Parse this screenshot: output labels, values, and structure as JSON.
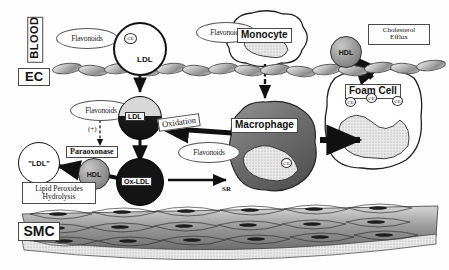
{
  "figure": {
    "type": "biomedical-pathway-diagram"
  },
  "compartments": {
    "blood": "BLOOD",
    "endothelium": "EC",
    "smooth_muscle": "SMC"
  },
  "particles": {
    "ldl_blood": "LDL",
    "ldl_intima": "LDL",
    "ox_ldl": "Ox-LDL",
    "hdl_efflux": "HDL",
    "hdl_paraoxonase": "HDL",
    "ldl_restored": "\"LDL\"",
    "ce_marker": "CE"
  },
  "cells": {
    "monocyte": "Monocyte",
    "macrophage": "Macrophage",
    "foam_cell": "Foam  Cell"
  },
  "flavonoids": {
    "blood": "Flavonoids",
    "monocyte": "Flavonoids",
    "intima": "Flavonoids",
    "macrophage": "Flavonoids"
  },
  "processes": {
    "oxidation": "Oxidation",
    "paraoxonase": "Paraoxonase",
    "lipid_peroxides_line1": "Lipid Peroxides",
    "lipid_peroxides_line2": "Hydrolysis",
    "cholesterol_efflux_line1": "Cholesterol",
    "cholesterol_efflux_line2": "Efflux",
    "activation_sign": "(+)",
    "scavenger_receptor": "SR",
    "efflux_receptor": "uc"
  },
  "colors": {
    "background": "#ffffff",
    "ink": "#111111",
    "ox_ldl_fill": "#141414",
    "macrophage_fill": "#6f6f6f",
    "hdl_fill": "#9a9a9a",
    "endothelium_fill": "#bdbdbd",
    "smc_fill": "#8d8d8d"
  }
}
